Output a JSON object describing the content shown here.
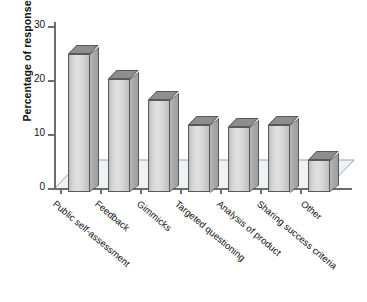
{
  "chart_data": {
    "type": "bar",
    "title": "",
    "subtitle": "",
    "xlabel": "",
    "ylabel": "Percentage of responses",
    "ylim": [
      0,
      30
    ],
    "yticks": [
      0,
      10,
      20,
      30
    ],
    "grid": false,
    "legend": null,
    "style": "3d-column",
    "categories": [
      "Public self-assessment",
      "Feedback",
      "Gimmicks",
      "Targeted questioning",
      "Analysis of product",
      "Sharing success criteria",
      "Other"
    ],
    "values": [
      25.5,
      21,
      17,
      12.5,
      12,
      12.5,
      6
    ],
    "annotations": []
  },
  "axis": {
    "y_title": "Percentage of responses",
    "y_tick_labels": [
      "0",
      "10",
      "20",
      "30"
    ]
  },
  "colors": {
    "bar_face": "#d9d9d9",
    "bar_side": "#a8a8a8",
    "bar_top": "#8e8e8e",
    "bar_outline": "#5a5a5a",
    "floor": "#eef2f5",
    "axis": "#6d6d6d",
    "text": "#111111",
    "background": "#ffffff"
  }
}
